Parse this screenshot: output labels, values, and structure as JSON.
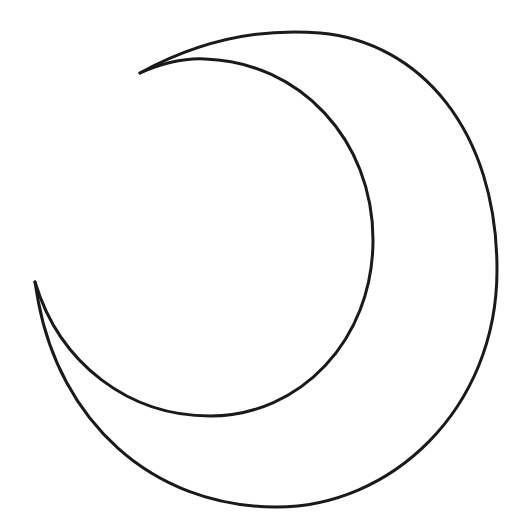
{
  "drawing": {
    "subject": "crescent moon outline",
    "stroke_color": "#1a1a1a",
    "background_color": "#ffffff",
    "stroke_width": 3
  }
}
